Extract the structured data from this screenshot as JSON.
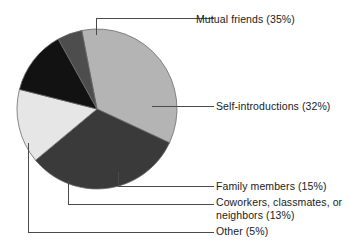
{
  "chart_data": {
    "type": "pie",
    "title": "",
    "subtitle": "",
    "xlabel": "",
    "ylabel": "",
    "legend_position": "callout-labels-right",
    "grid": false,
    "start_angle_deg": 349,
    "direction": "clockwise",
    "categories": [
      "Mutual friends",
      "Self-introductions",
      "Family members",
      "Coworkers, classmates, or neighbors",
      "Other"
    ],
    "values": [
      35,
      32,
      15,
      13,
      5
    ],
    "value_unit": "%",
    "colors": [
      "#b4b4b4",
      "#3a3a3a",
      "#e6e6e6",
      "#121212",
      "#4d4d4d"
    ],
    "slices": [
      {
        "label": "Mutual friends",
        "value": 35,
        "display": "Mutual friends (35%)",
        "color": "#b4b4b4"
      },
      {
        "label": "Self-introductions",
        "value": 32,
        "display": "Self-introductions (32%)",
        "color": "#3a3a3a"
      },
      {
        "label": "Family members",
        "value": 15,
        "display": "Family members (15%)",
        "color": "#e6e6e6"
      },
      {
        "label": "Coworkers, classmates, or neighbors",
        "value": 13,
        "display": "Coworkers, classmates, or neighbors (13%)",
        "color": "#121212"
      },
      {
        "label": "Other",
        "value": 5,
        "display": "Other (5%)",
        "color": "#4d4d4d"
      }
    ]
  },
  "labels": {
    "mutual_friends": "Mutual friends (35%)",
    "self_introductions": "Self-introductions (32%)",
    "family_members": "Family members (15%)",
    "coworkers": "Coworkers, classmates, or neighbors (13%)",
    "other": "Other (5%)"
  },
  "style": {
    "background": "#ffffff",
    "text_color": "#1a1a1a",
    "leader_line_color": "#4a4a4a",
    "slice_edge_color": "#6b6b6b"
  }
}
